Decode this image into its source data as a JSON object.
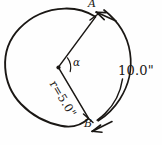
{
  "figure": {
    "ink_color": "#1a1714",
    "background_color": "#fefefe",
    "circle": {
      "center_x": 58,
      "center_y": 68,
      "radius": 58
    },
    "center_point_label": "",
    "points": {
      "a": {
        "label": "A",
        "x": 95,
        "y": 16
      },
      "b": {
        "label": "B",
        "x": 88,
        "y": 118
      }
    },
    "angle": {
      "symbol": "α",
      "vertex_x": 58,
      "vertex_y": 68
    },
    "radius_label": "r=5.0\"",
    "arc_label": "10.0\"",
    "dimension_arc": {
      "has_arrowhead_start": true,
      "has_arrowhead_end": true
    }
  }
}
